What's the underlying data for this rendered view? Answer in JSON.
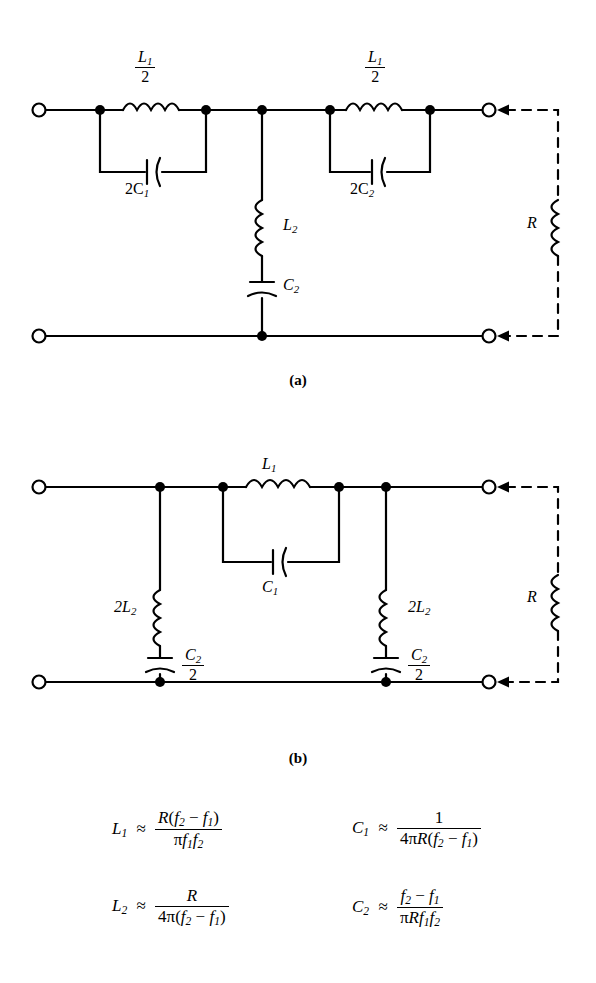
{
  "figure": {
    "type": "band-pass-filter-circuits",
    "captions": {
      "a": "(a)",
      "b": "(b)"
    }
  },
  "circuit_a": {
    "caption": "(a)",
    "series_branch_left": {
      "inductor": "L1/2",
      "inductor_num": "L",
      "inductor_sub": "1",
      "inductor_den": "2",
      "capacitor": "2C1"
    },
    "series_branch_right": {
      "inductor": "L1/2",
      "inductor_num": "L",
      "inductor_sub": "1",
      "inductor_den": "2",
      "capacitor": "2C2"
    },
    "shunt_branch": {
      "inductor": "L2",
      "inductor_base": "L",
      "inductor_sub": "2",
      "capacitor": "C2",
      "capacitor_base": "C",
      "capacitor_sub": "2"
    },
    "load": {
      "label": "R",
      "style": "dashed"
    },
    "labels": {
      "L_half_num": "L",
      "L_half_sub": "1",
      "L_half_den": "2",
      "cap_left": "2C",
      "cap_left_sub": "1",
      "cap_right": "2C",
      "cap_right_sub": "2",
      "shunt_L": "L",
      "shunt_L_sub": "2",
      "shunt_C": "C",
      "shunt_C_sub": "2",
      "load": "R"
    }
  },
  "circuit_b": {
    "caption": "(b)",
    "series_branch": {
      "inductor": "L1",
      "inductor_base": "L",
      "inductor_sub": "1",
      "capacitor": "C1",
      "capacitor_base": "C",
      "capacitor_sub": "1"
    },
    "shunt_branch_left": {
      "inductor": "2L2",
      "inductor_base": "2L",
      "inductor_sub": "2",
      "capacitor": "C2/2",
      "capacitor_num": "C",
      "capacitor_sub": "2",
      "capacitor_den": "2"
    },
    "shunt_branch_right": {
      "inductor": "2L2",
      "inductor_base": "2L",
      "inductor_sub": "2",
      "capacitor": "C2/2",
      "capacitor_num": "C",
      "capacitor_sub": "2",
      "capacitor_den": "2"
    },
    "load": {
      "label": "R",
      "style": "dashed"
    }
  },
  "formulas": [
    {
      "id": "L1",
      "lhs_base": "L",
      "lhs_sub": "1",
      "relation": "≈",
      "numerator": "R(f2 − f1)",
      "denominator": "πf1f2",
      "plain": "L1 ≈ R(f2 − f1) / (π f1 f2)"
    },
    {
      "id": "C1",
      "lhs_base": "C",
      "lhs_sub": "1",
      "relation": "≈",
      "numerator": "1",
      "denominator": "4πR(f2 − f1)",
      "plain": "C1 ≈ 1 / (4πR(f2 − f1))"
    },
    {
      "id": "L2",
      "lhs_base": "L",
      "lhs_sub": "2",
      "relation": "≈",
      "numerator": "R",
      "denominator": "4π(f2 − f1)",
      "plain": "L2 ≈ R / (4π(f2 − f1))"
    },
    {
      "id": "C2",
      "lhs_base": "C",
      "lhs_sub": "2",
      "relation": "≈",
      "numerator": "f2 − f1",
      "denominator": "πRf1f2",
      "plain": "C2 ≈ (f2 − f1) / (πR f1 f2)"
    }
  ],
  "symbols": {
    "pi": "π",
    "minus": "−",
    "approx": "≈",
    "R": "R",
    "f": "f",
    "one": "1",
    "two": "2",
    "four": "4"
  },
  "colors": {
    "ink": "#000000",
    "paper": "#ffffff"
  }
}
